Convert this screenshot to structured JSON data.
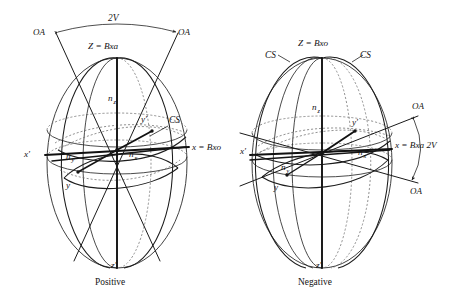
{
  "figure": {
    "type": "biaxial-indicatrix-stereographic-pair",
    "background_color": "#ffffff",
    "line_color": "#1a1a1a",
    "dashed_color": "#6d6d6d"
  },
  "panels": [
    {
      "id": "positive",
      "caption": "Positive",
      "top_axis_label": "Z = Bxa",
      "right_axis_label": "x = Bxo",
      "angle_label": "2V",
      "angle_arrow_labels": [
        "OA",
        "OA"
      ],
      "circular_section_labels": [
        "CS"
      ],
      "index_labels": [
        "n",
        "n",
        "n"
      ],
      "index_subscripts": [
        "z",
        "y",
        "x"
      ],
      "prime_axis_labels": [
        "x'",
        "y'",
        "z'"
      ],
      "unprimed_axis_labels": [
        "y"
      ]
    },
    {
      "id": "negative",
      "caption": "Negative",
      "top_axis_label": "Z = Bxo",
      "right_axis_label": "x = Bxa 2V",
      "circular_section_labels": [
        "CS",
        "CS"
      ],
      "angle_arrow_labels": [
        "OA",
        "OA"
      ],
      "index_labels": [
        "n",
        "n",
        "n"
      ],
      "index_subscripts": [
        "z",
        "y",
        "x"
      ],
      "prime_axis_labels": [
        "x'",
        "y'",
        "z'"
      ],
      "unprimed_axis_labels": [
        "y"
      ]
    }
  ],
  "labels": {
    "left": {
      "twoV": "2V",
      "oa_left": "OA",
      "oa_right": "OA",
      "z_bxa": "Z = Bxa",
      "n_z": "n",
      "n_z_sub": "z",
      "n_y": "n",
      "n_y_sub": "y",
      "n_x": "n",
      "n_x_sub": "x",
      "y_prime": "y'",
      "cs": "CS",
      "x_bxo": "x = Bxo",
      "x_prime": "x'",
      "y": "y",
      "z_prime": "z'",
      "caption": "Positive"
    },
    "right": {
      "z_bxo": "Z = Bxo",
      "cs_left": "CS",
      "cs_right": "CS",
      "n_z": "n",
      "n_z_sub": "z",
      "n_y": "n",
      "n_y_sub": "y",
      "n_x": "n",
      "n_x_sub": "x",
      "y_prime": "y'",
      "oa_upper": "OA",
      "oa_lower": "OA",
      "x_bxa_2v": "x = Bxa 2V",
      "x_prime": "x'",
      "y": "y",
      "z_prime": "z'",
      "caption": "Negative"
    }
  }
}
